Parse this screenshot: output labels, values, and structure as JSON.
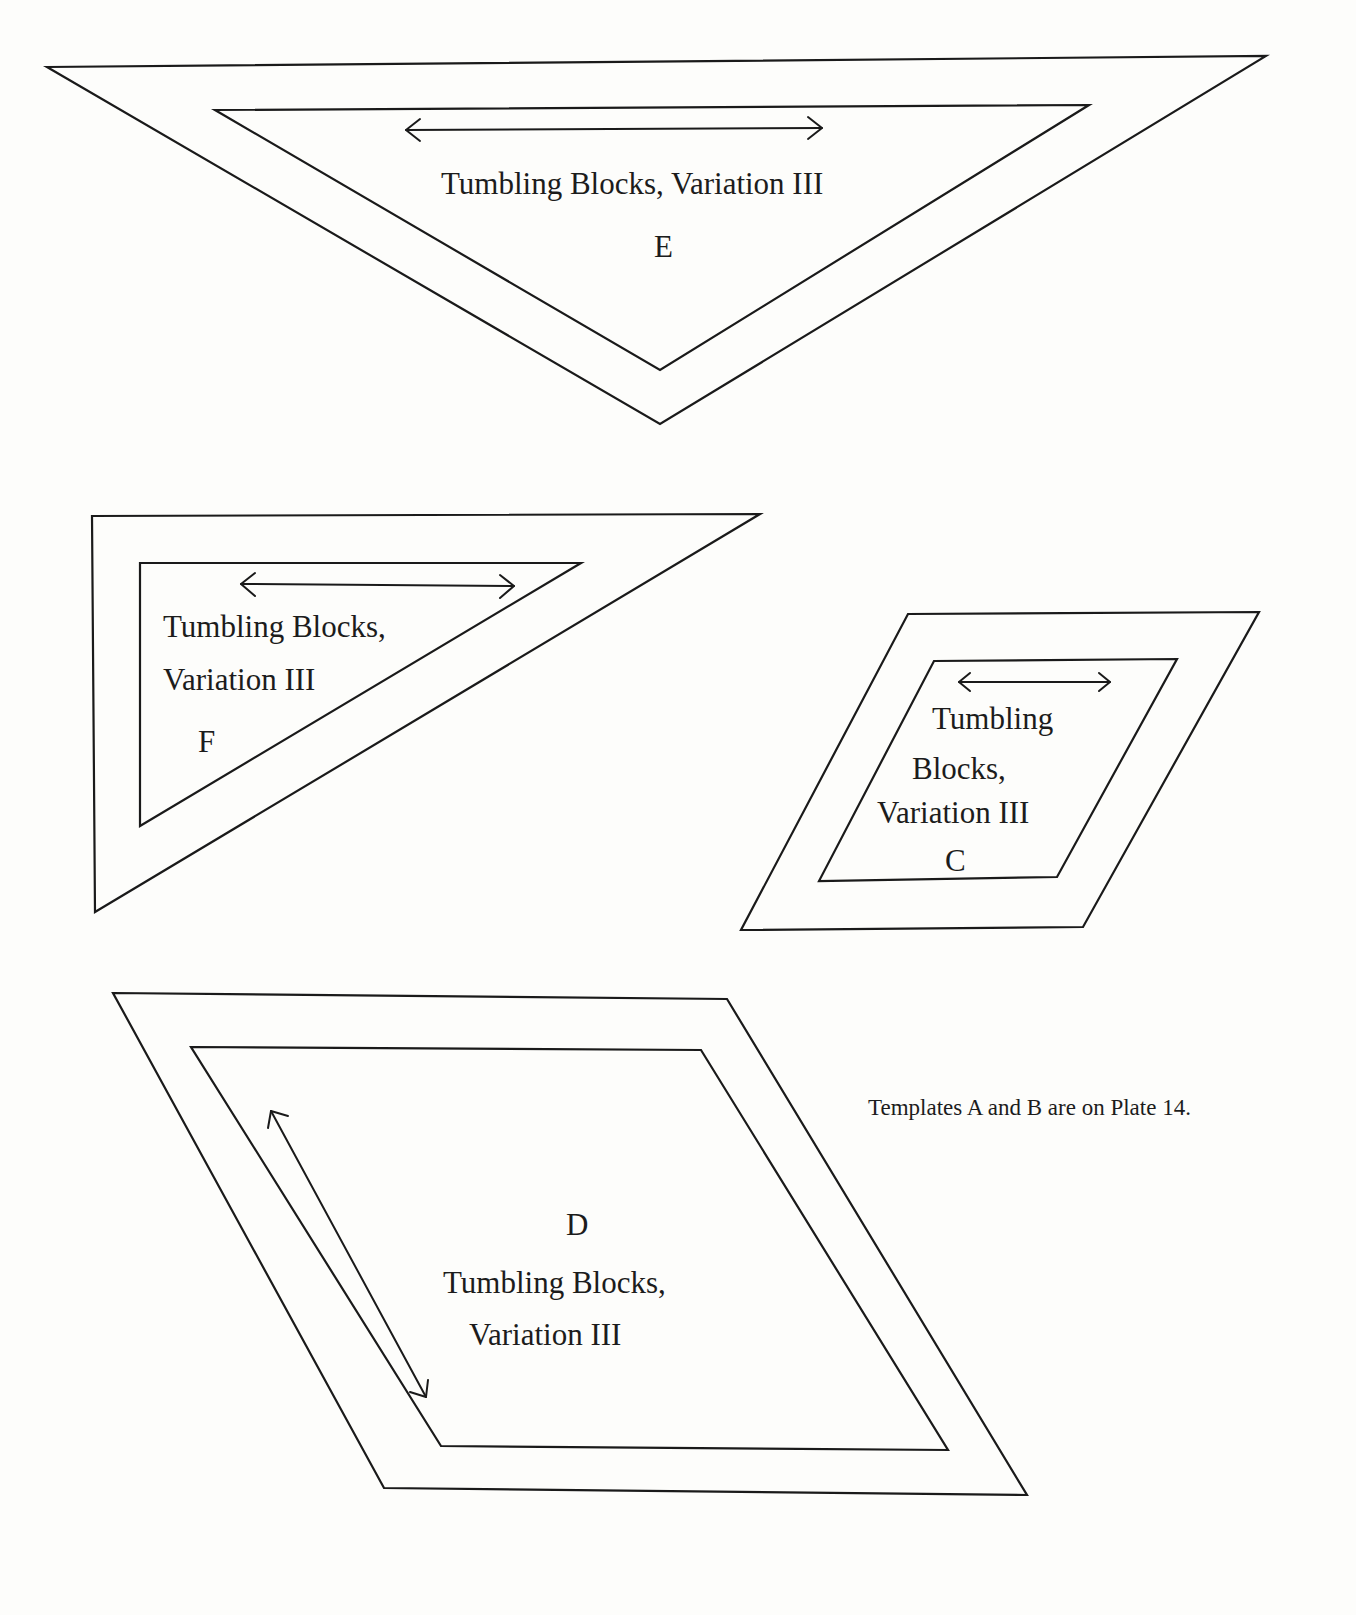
{
  "templates": {
    "E": {
      "letter": "E",
      "title": "Tumbling Blocks, Variation III",
      "shape": "triangle",
      "grain_arrow": "horizontal"
    },
    "F": {
      "letter": "F",
      "title_line1": "Tumbling Blocks,",
      "title_line2": "Variation III",
      "shape": "right-triangle",
      "grain_arrow": "horizontal"
    },
    "C": {
      "letter": "C",
      "title_line1": "Tumbling",
      "title_line2": "Blocks,",
      "title_line3": "Variation III",
      "shape": "parallelogram",
      "grain_arrow": "horizontal"
    },
    "D": {
      "letter": "D",
      "title_line1": "Tumbling Blocks,",
      "title_line2": "Variation III",
      "shape": "parallelogram",
      "grain_arrow": "diagonal"
    }
  },
  "note": "Templates A and B are on Plate 14.",
  "colors": {
    "line": "#1a1a1a",
    "paper": "#fdfdfb"
  }
}
